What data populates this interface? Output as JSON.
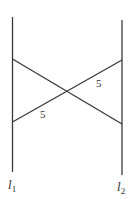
{
  "diagram": {
    "lines": {
      "l1": {
        "label": "l",
        "subscript": "1"
      },
      "l2": {
        "label": "l",
        "subscript": "2"
      }
    },
    "segments": [
      {
        "name": "upper-crossing-segment",
        "label": "5"
      },
      {
        "name": "lower-crossing-segment",
        "label": "5"
      }
    ],
    "colors": {
      "stroke": "#3a3a3a",
      "background": "#ffffff"
    }
  }
}
